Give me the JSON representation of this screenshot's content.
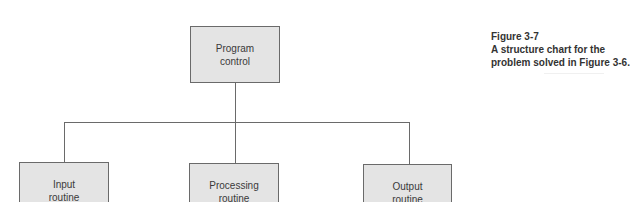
{
  "diagram": {
    "type": "structure-chart",
    "colors": {
      "box_fill": "#e4e4e4",
      "box_border": "#6a6a6a",
      "text": "#3a3a3a",
      "caption_text": "#333333"
    },
    "root": {
      "line1": "Program",
      "line2": "control"
    },
    "children": [
      {
        "line1": "Input",
        "line2": "routine"
      },
      {
        "line1": "Processing",
        "line2": "routine"
      },
      {
        "line1": "Output",
        "line2": "routine"
      }
    ]
  },
  "caption": {
    "figure_label": "Figure 3-7",
    "line1": "A structure chart for the",
    "line2": "problem solved in Figure 3-6."
  }
}
